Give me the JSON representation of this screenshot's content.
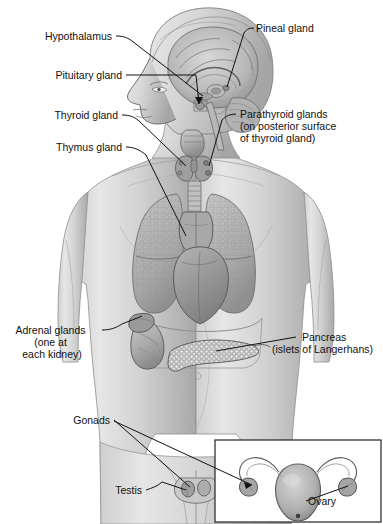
{
  "figure": {
    "background_color": "#ffffff",
    "line_color": "#111111",
    "body_tone_light": "#e2e2e2",
    "body_tone_mid": "#c4c4c4",
    "body_tone_dark": "#9a9a9a",
    "organ_tone": "#b5b5b5",
    "organ_tone_dark": "#8d8d8d"
  },
  "labels": [
    {
      "id": "hypothalamus",
      "text": "Hypothalamus",
      "x": 112,
      "y": 40,
      "anchor": "end"
    },
    {
      "id": "pineal",
      "text": "Pineal gland",
      "x": 256,
      "y": 32,
      "anchor": "start"
    },
    {
      "id": "pituitary",
      "text": "Pituitary gland",
      "x": 122,
      "y": 79,
      "anchor": "end"
    },
    {
      "id": "thyroid",
      "text": "Thyroid gland",
      "x": 118,
      "y": 119,
      "anchor": "end"
    },
    {
      "id": "thymus",
      "text": "Thymus gland",
      "x": 122,
      "y": 151,
      "anchor": "end"
    },
    {
      "id": "testis",
      "text": "Testis",
      "x": 142,
      "y": 494,
      "anchor": "end"
    },
    {
      "id": "gonads",
      "text": "Gonads",
      "x": 110,
      "y": 424,
      "anchor": "end"
    },
    {
      "id": "ovary",
      "text": "Ovary",
      "x": 308,
      "y": 505,
      "anchor": "start"
    }
  ],
  "multiline_labels": [
    {
      "id": "parathyroid",
      "x": 240,
      "y": 118,
      "anchor": "start",
      "line_height": 12,
      "lines": [
        "Parathyroid glands",
        "(on posterior surface",
        "of thyroid gland)"
      ]
    },
    {
      "id": "adrenal",
      "x": 98,
      "y": 334,
      "anchor": "end",
      "line_height": 12,
      "lines": [
        "Adrenal glands",
        "(one at",
        "each kidney)"
      ]
    },
    {
      "id": "pancreas",
      "x": 300,
      "y": 341,
      "anchor": "start",
      "line_height": 12,
      "lines": [
        "Pancreas",
        "(islets of Langerhans)"
      ]
    }
  ],
  "inset": {
    "id": "female-gonads-inset",
    "x": 215,
    "y": 440,
    "width": 166,
    "height": 82,
    "contents": "uterus with fallopian tubes and ovaries"
  },
  "organs": [
    {
      "id": "brain",
      "name": "brain-sagittal-section"
    },
    {
      "id": "cerebellum",
      "name": "cerebellum"
    },
    {
      "id": "pineal-gland",
      "name": "pineal-gland"
    },
    {
      "id": "pituitary-gland",
      "name": "pituitary-gland"
    },
    {
      "id": "larynx",
      "name": "larynx"
    },
    {
      "id": "thyroid-gland",
      "name": "thyroid-gland"
    },
    {
      "id": "parathyroid-glands",
      "name": "parathyroid-glands"
    },
    {
      "id": "trachea",
      "name": "trachea"
    },
    {
      "id": "thymus-gland",
      "name": "thymus-gland"
    },
    {
      "id": "lung-left",
      "name": "lung"
    },
    {
      "id": "lung-right",
      "name": "lung"
    },
    {
      "id": "heart",
      "name": "heart"
    },
    {
      "id": "diaphragm",
      "name": "diaphragm"
    },
    {
      "id": "kidney",
      "name": "kidney"
    },
    {
      "id": "adrenal-gland",
      "name": "adrenal-gland"
    },
    {
      "id": "pancreas-organ",
      "name": "pancreas"
    },
    {
      "id": "testis-organ",
      "name": "testis"
    },
    {
      "id": "uterus",
      "name": "uterus"
    },
    {
      "id": "ovary-left",
      "name": "ovary"
    },
    {
      "id": "ovary-right",
      "name": "ovary"
    }
  ]
}
